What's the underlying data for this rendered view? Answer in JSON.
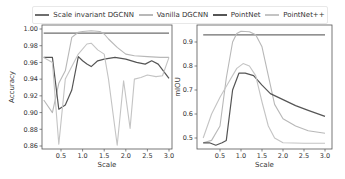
{
  "legend": {
    "items": [
      {
        "label": "Scale invariant DGCNN",
        "color": "#6e6e6e"
      },
      {
        "label": "Vanilla DGCNN",
        "color": "#b8b8b8"
      },
      {
        "label": "PointNet",
        "color": "#555555"
      },
      {
        "label": "PointNet++",
        "color": "#c4c4c4"
      }
    ]
  },
  "chart_data": [
    {
      "type": "line",
      "title": "",
      "xlabel": "Scale",
      "ylabel": "Accuracy",
      "xlim": [
        0.05,
        3.05
      ],
      "ylim": [
        0.855,
        1.002
      ],
      "xticks": [
        "0.5",
        "1.0",
        "1.5",
        "2.0",
        "2.5",
        "3.0"
      ],
      "yticks": [
        "0.86",
        "0.88",
        "0.90",
        "0.92",
        "0.94",
        "0.96",
        "0.98",
        "1.00"
      ],
      "grid": false,
      "legend_position": "top (shared)",
      "series": [
        {
          "name": "Scale invariant DGCNN",
          "x": [
            0.1,
            3.0
          ],
          "values": [
            0.995,
            0.995
          ]
        },
        {
          "name": "Vanilla DGCNN",
          "x": [
            0.1,
            0.3,
            0.45,
            0.6,
            0.75,
            0.9,
            1.0,
            1.2,
            1.4,
            1.5,
            1.6,
            1.8,
            2.0,
            2.2,
            2.5,
            2.8,
            3.0
          ],
          "values": [
            0.915,
            0.9,
            0.935,
            0.95,
            0.99,
            0.996,
            0.997,
            0.998,
            0.997,
            0.994,
            0.988,
            0.978,
            0.97,
            0.968,
            0.967,
            0.966,
            0.966
          ]
        },
        {
          "name": "PointNet",
          "x": [
            0.1,
            0.3,
            0.45,
            0.6,
            0.75,
            0.9,
            1.0,
            1.1,
            1.2,
            1.35,
            1.5,
            1.75,
            2.0,
            2.25,
            2.45,
            2.6,
            2.75,
            3.0
          ],
          "values": [
            0.966,
            0.966,
            0.904,
            0.909,
            0.927,
            0.967,
            0.962,
            0.958,
            0.955,
            0.962,
            0.964,
            0.966,
            0.964,
            0.96,
            0.958,
            0.962,
            0.958,
            0.941
          ]
        },
        {
          "name": "PointNet++",
          "x": [
            0.1,
            0.3,
            0.45,
            0.6,
            0.75,
            0.9,
            1.1,
            1.2,
            1.35,
            1.5,
            1.6,
            1.8,
            1.95,
            2.1,
            2.2,
            2.35,
            2.5,
            2.7,
            2.85,
            3.0
          ],
          "values": [
            0.966,
            0.96,
            0.862,
            0.94,
            0.955,
            0.97,
            0.982,
            0.983,
            0.975,
            0.97,
            0.94,
            0.861,
            0.938,
            0.881,
            0.94,
            0.942,
            0.945,
            0.943,
            0.944,
            0.966
          ]
        }
      ]
    },
    {
      "type": "line",
      "title": "",
      "xlabel": "Scale",
      "ylabel": "mIOU",
      "xlim": [
        0.05,
        3.05
      ],
      "ylim": [
        0.455,
        0.97
      ],
      "xticks": [
        "0.5",
        "1.0",
        "1.5",
        "2.0",
        "2.5",
        "3.0"
      ],
      "yticks": [
        "0.5",
        "0.6",
        "0.7",
        "0.8",
        "0.9"
      ],
      "grid": false,
      "legend_position": "top (shared)",
      "series": [
        {
          "name": "Scale invariant DGCNN",
          "x": [
            0.1,
            3.0
          ],
          "values": [
            0.93,
            0.93
          ]
        },
        {
          "name": "Vanilla DGCNN",
          "x": [
            0.1,
            0.3,
            0.5,
            0.65,
            0.8,
            0.9,
            1.0,
            1.2,
            1.35,
            1.5,
            1.65,
            1.8,
            2.0,
            2.3,
            2.6,
            3.0
          ],
          "values": [
            0.48,
            0.49,
            0.55,
            0.75,
            0.9,
            0.935,
            0.945,
            0.943,
            0.93,
            0.88,
            0.76,
            0.64,
            0.58,
            0.55,
            0.53,
            0.52
          ]
        },
        {
          "name": "PointNet",
          "x": [
            0.1,
            0.25,
            0.4,
            0.55,
            0.65,
            0.8,
            0.95,
            1.1,
            1.3,
            1.5,
            1.7,
            2.0,
            2.3,
            2.6,
            3.0
          ],
          "values": [
            0.48,
            0.48,
            0.47,
            0.48,
            0.49,
            0.7,
            0.77,
            0.77,
            0.76,
            0.72,
            0.685,
            0.66,
            0.635,
            0.615,
            0.59
          ]
        },
        {
          "name": "PointNet++",
          "x": [
            0.1,
            0.3,
            0.5,
            0.7,
            0.9,
            1.05,
            1.2,
            1.35,
            1.5,
            1.65,
            1.8,
            2.0,
            2.5,
            3.0
          ],
          "values": [
            0.5,
            0.6,
            0.67,
            0.73,
            0.79,
            0.81,
            0.8,
            0.76,
            0.65,
            0.55,
            0.5,
            0.48,
            0.478,
            0.478
          ]
        }
      ]
    }
  ]
}
